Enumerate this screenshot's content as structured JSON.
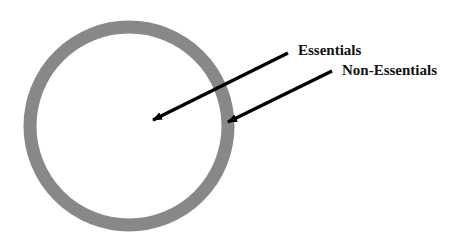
{
  "diagram": {
    "type": "concentric-ring",
    "ring": {
      "center_x": 129,
      "center_y": 126,
      "radius": 99,
      "thickness": 13,
      "color": "#888888"
    },
    "labels": [
      {
        "id": "essentials",
        "text": "Essentials",
        "points_to": "inner circle"
      },
      {
        "id": "non-essentials",
        "text": "Non-Essentials",
        "points_to": "outer ring"
      }
    ],
    "arrow_color": "#000000"
  }
}
